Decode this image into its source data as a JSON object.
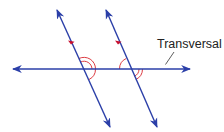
{
  "diagram": {
    "labels": {
      "transversal": "Transversal"
    },
    "colors": {
      "line": "#2b3fa8",
      "angle_mark": "#d8262e",
      "tick": "#c8102e",
      "text": "#222222",
      "leader": "#333333"
    },
    "lines": [
      {
        "name": "transversal",
        "x1": 13,
        "y1": 69,
        "x2": 190,
        "y2": 69
      },
      {
        "name": "parallel-line-left",
        "x1": 57,
        "y1": 10,
        "x2": 110,
        "y2": 127
      },
      {
        "name": "parallel-line-right",
        "x1": 106,
        "y1": 10,
        "x2": 157,
        "y2": 127
      }
    ],
    "angle_marks": [
      {
        "at": "left-intersection",
        "position": "upper-right",
        "arcs": 2
      },
      {
        "at": "left-intersection",
        "position": "lower-right",
        "arcs": 1
      },
      {
        "at": "right-intersection",
        "position": "upper-left",
        "arcs": 1
      },
      {
        "at": "right-intersection",
        "position": "lower-right",
        "arcs": 2
      }
    ],
    "parallel_ticks": 2
  }
}
